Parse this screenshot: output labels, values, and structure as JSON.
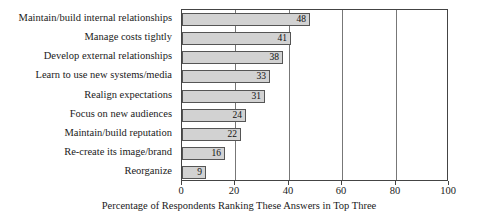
{
  "chart_data": {
    "type": "bar",
    "orientation": "horizontal",
    "title": "",
    "xlabel": "Percentage of Respondents Ranking These Answers in Top Three",
    "ylabel": "",
    "xlim": [
      0,
      100
    ],
    "xticks": [
      0,
      20,
      40,
      60,
      80,
      100
    ],
    "xtick_labels": [
      "0",
      "20",
      "40",
      "60",
      "80",
      "100"
    ],
    "grid": true,
    "grid_axis": "x",
    "legend": false,
    "categories": [
      "Maintain/build internal relationships",
      "Manage costs tightly",
      "Develop external relationships",
      "Learn to use new systems/media",
      "Realign expectations",
      "Focus on new audiences",
      "Maintain/build reputation",
      "Re-create its image/brand",
      "Reorganize"
    ],
    "values": [
      48,
      41,
      38,
      33,
      31,
      24,
      22,
      16,
      9
    ],
    "value_labels": [
      "48",
      "41",
      "38",
      "33",
      "31",
      "24",
      "22",
      "16",
      "9"
    ],
    "colors": {
      "bar_fill": "#d2d2d2",
      "bar_border": "#555555",
      "gridline": "#777777",
      "axis": "#444444",
      "text": "#1a1a1a",
      "background": "#ffffff"
    }
  }
}
